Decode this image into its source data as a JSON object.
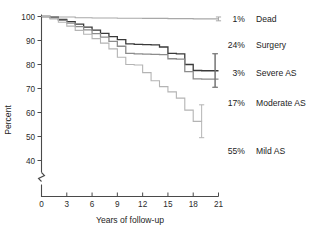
{
  "chart_data": {
    "type": "line",
    "title": "",
    "subtitle": "",
    "xlabel": "Years of follow-up",
    "ylabel": "Percent",
    "xlim": [
      0,
      21
    ],
    "ylim": [
      36,
      100
    ],
    "grid": false,
    "legend_position": "right-inline-annotations",
    "axis_break_y": true,
    "xticks": [
      0,
      3,
      6,
      9,
      12,
      15,
      18,
      21
    ],
    "xticklabels": [
      "0",
      "3",
      "6",
      "9",
      "12",
      "15",
      "18",
      "21"
    ],
    "yticks": [
      40,
      50,
      60,
      70,
      80,
      90,
      100
    ],
    "yticklabels": [
      "40",
      "50",
      "60",
      "70",
      "80",
      "90",
      "100"
    ],
    "series": [
      {
        "name": "Dead",
        "color": "#a8a8a8",
        "width": 1.1,
        "x": [
          0,
          1,
          2,
          4,
          6,
          9,
          12,
          15,
          18,
          21
        ],
        "y": [
          100,
          100,
          99.8,
          99.5,
          99.4,
          99.3,
          99.2,
          99.1,
          99.0,
          99.0
        ],
        "error_bar": {
          "x": 21,
          "y": 99.0,
          "low": 98.2,
          "high": 99.8
        }
      },
      {
        "name": "Surgery",
        "color": "#3a3a3a",
        "width": 1.3,
        "x": [
          0,
          1,
          2,
          3,
          4,
          5,
          6,
          7,
          8,
          9,
          10,
          11,
          12,
          13,
          14,
          15,
          16,
          17,
          18,
          19,
          20,
          21
        ],
        "y": [
          100,
          99.6,
          98.8,
          97.9,
          96.8,
          95.6,
          94.3,
          93.0,
          91.6,
          90.4,
          88.6,
          88.4,
          88.3,
          88.2,
          87.3,
          84.6,
          84.4,
          80.0,
          77.5,
          77.4,
          77.4,
          77.4
        ],
        "error_bar": {
          "x": 20.6,
          "y": 84.0,
          "low": 70.5,
          "high": 84.5
        }
      },
      {
        "name": "Severe AS",
        "color": "#8c8c8c",
        "width": 1.3,
        "x": [
          0,
          1,
          2,
          3,
          4,
          5,
          6,
          7,
          8,
          9,
          10,
          11,
          12,
          13,
          14,
          15,
          16,
          17,
          18,
          19,
          20,
          21
        ],
        "y": [
          100,
          99.4,
          98.4,
          97.2,
          95.8,
          94.4,
          92.9,
          91.4,
          89.6,
          87.6,
          84.6,
          84.4,
          84.3,
          84.2,
          84.1,
          82.4,
          82.2,
          77.0,
          74.0,
          73.9,
          73.9,
          73.9
        ],
        "error_bar": {
          "x": 20.6,
          "y": 74.0,
          "low": 70.5,
          "high": 84.5
        }
      },
      {
        "name": "Moderate AS",
        "color": "#b4b4b4",
        "width": 1.1,
        "x": [
          0,
          1,
          2,
          3,
          4,
          5,
          6,
          7,
          8,
          9,
          10,
          11,
          12,
          13,
          14,
          15,
          16,
          17,
          18,
          19
        ],
        "y": [
          100,
          99.0,
          97.6,
          96.0,
          94.2,
          92.6,
          90.8,
          88.9,
          86.5,
          83.0,
          80.0,
          79.8,
          76.6,
          73.2,
          70.8,
          68.6,
          66.0,
          61.0,
          56.3,
          56.2
        ],
        "error_bar": {
          "x": 19.0,
          "y": 56.3,
          "low": 49.5,
          "high": 63.2
        }
      }
    ],
    "annotations": [
      {
        "percent": "1%",
        "label": "Dead",
        "y_value": 99.0
      },
      {
        "percent": "24%",
        "label": "Surgery",
        "y_value": 88.0
      },
      {
        "percent": "3%",
        "label": "Severe AS",
        "y_value": 76.5
      },
      {
        "percent": "17%",
        "label": "Moderate AS",
        "y_value": 64.0
      },
      {
        "percent": "55%",
        "label": "Mild AS",
        "y_value": 44.0
      }
    ]
  },
  "colors": {
    "axis": "#4a4a4a",
    "text": "#1d1d1d",
    "background": "#ffffff"
  }
}
